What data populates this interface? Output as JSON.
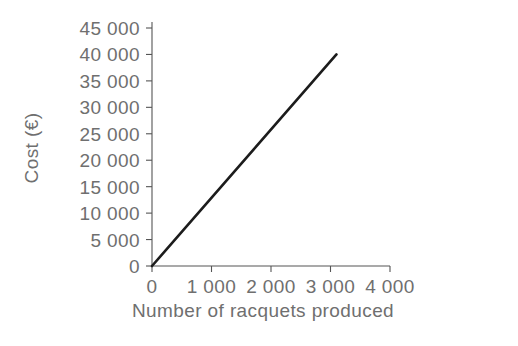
{
  "chart_data": {
    "type": "line",
    "title": "",
    "subtitle": "",
    "xlabel": "Number of  racquets produced",
    "ylabel": "Cost (€)",
    "x_tick_labels": [
      "0",
      "1 000",
      "2 000",
      "3 000",
      "4 000"
    ],
    "x_ticks": [
      0,
      1000,
      2000,
      3000,
      4000
    ],
    "y_tick_labels": [
      "0",
      "5 000",
      "10 000",
      "15 000",
      "20 000",
      "25 000",
      "30 000",
      "35 000",
      "40 000",
      "45 000"
    ],
    "y_ticks": [
      0,
      5000,
      10000,
      15000,
      20000,
      25000,
      30000,
      35000,
      40000,
      45000
    ],
    "xlim": [
      0,
      4000
    ],
    "ylim": [
      0,
      45000
    ],
    "grid": false,
    "legend": false,
    "legend_position": "none",
    "series": [
      {
        "name": "Cost",
        "x": [
          0,
          3100
        ],
        "values": [
          0,
          40000
        ],
        "color": "#1c1c1c",
        "line_width": 2.6,
        "style": "solid",
        "markers": false
      }
    ],
    "annotations": [],
    "slope_per_unit": 12.9,
    "intercept": 0
  },
  "axes": {
    "axis_color": "#555555",
    "axis_width": 1.1,
    "tick_length": 6,
    "tick_direction": "outward",
    "text_color": "#6f6f6f"
  },
  "background": {
    "color": "#ffffff"
  }
}
